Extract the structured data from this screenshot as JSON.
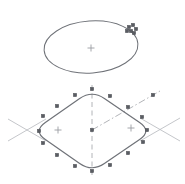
{
  "document": {
    "title": "CAD Isometric Sketch",
    "background_color": "#ffffff",
    "width": 185,
    "height": 184,
    "view": "isometric"
  },
  "palette": {
    "entity_line": "#6f7278",
    "entity_line_light": "#8b8e93",
    "grip_fill": "#5a5d63",
    "grip_stroke": "#4a4d52",
    "centerline": "#a9abb0",
    "construction_line": "#b5b7bc",
    "center_mark": "#9a9ca1"
  },
  "drawing": {
    "entities": [
      {
        "id": "iso-ellipse",
        "name": "isometric-circle",
        "type": "ellipse",
        "cx": 91,
        "cy": 47,
        "rx": 47,
        "ry": 26,
        "rotation_deg": -4,
        "selected": true,
        "center_mark": {
          "x": 91,
          "y": 48,
          "size": 7
        }
      },
      {
        "id": "iso-rounded-diamond",
        "name": "isometric-rounded-rectangle",
        "type": "rounded-polygon",
        "selected": true,
        "corner_radius": 15,
        "vertices": [
          {
            "x": 92,
            "y": 90
          },
          {
            "x": 152,
            "y": 131
          },
          {
            "x": 92,
            "y": 172
          },
          {
            "x": 33,
            "y": 131
          }
        ],
        "center_marks": [
          {
            "x": 58,
            "y": 130,
            "size": 7
          },
          {
            "x": 131,
            "y": 128,
            "size": 7
          }
        ]
      }
    ],
    "grips": {
      "name": "selection-grips",
      "shape": "square",
      "size": 3.4,
      "ellipse_cluster": [
        {
          "x": 129,
          "y": 27
        },
        {
          "x": 133,
          "y": 25
        },
        {
          "x": 131,
          "y": 31
        },
        {
          "x": 136,
          "y": 29
        },
        {
          "x": 127,
          "y": 31
        },
        {
          "x": 134,
          "y": 33
        }
      ],
      "diamond_points": [
        {
          "x": 92,
          "y": 89
        },
        {
          "x": 75,
          "y": 95
        },
        {
          "x": 110,
          "y": 96
        },
        {
          "x": 57,
          "y": 106
        },
        {
          "x": 128,
          "y": 107
        },
        {
          "x": 43,
          "y": 116
        },
        {
          "x": 142,
          "y": 117
        },
        {
          "x": 39,
          "y": 131
        },
        {
          "x": 147,
          "y": 130
        },
        {
          "x": 43,
          "y": 143
        },
        {
          "x": 143,
          "y": 142
        },
        {
          "x": 57,
          "y": 155
        },
        {
          "x": 128,
          "y": 153
        },
        {
          "x": 75,
          "y": 166
        },
        {
          "x": 110,
          "y": 165
        },
        {
          "x": 92,
          "y": 171
        },
        {
          "x": 92,
          "y": 130
        }
      ],
      "detached_point": {
        "x": 153,
        "y": 95
      }
    },
    "centerlines": [
      {
        "id": "vertical-centerline",
        "name": "vertical-centerline",
        "style": "dashed",
        "x1": 92,
        "y1": 85,
        "x2": 92,
        "y2": 177
      },
      {
        "id": "diagonal-centerline",
        "name": "diagonal-centerline",
        "style": "dash-dot",
        "x1": 92,
        "y1": 130,
        "x2": 160,
        "y2": 91
      }
    ],
    "construction_lines": [
      {
        "id": "left-cross-a",
        "name": "construction-line-left-a",
        "x1": 8,
        "y1": 119,
        "x2": 46,
        "y2": 141
      },
      {
        "id": "left-cross-b",
        "name": "construction-line-left-b",
        "x1": 8,
        "y1": 141,
        "x2": 46,
        "y2": 119
      },
      {
        "id": "right-cross-a",
        "name": "construction-line-right-a",
        "x1": 140,
        "y1": 118,
        "x2": 180,
        "y2": 141
      },
      {
        "id": "right-cross-b",
        "name": "construction-line-right-b",
        "x1": 140,
        "y1": 141,
        "x2": 180,
        "y2": 118
      }
    ]
  }
}
